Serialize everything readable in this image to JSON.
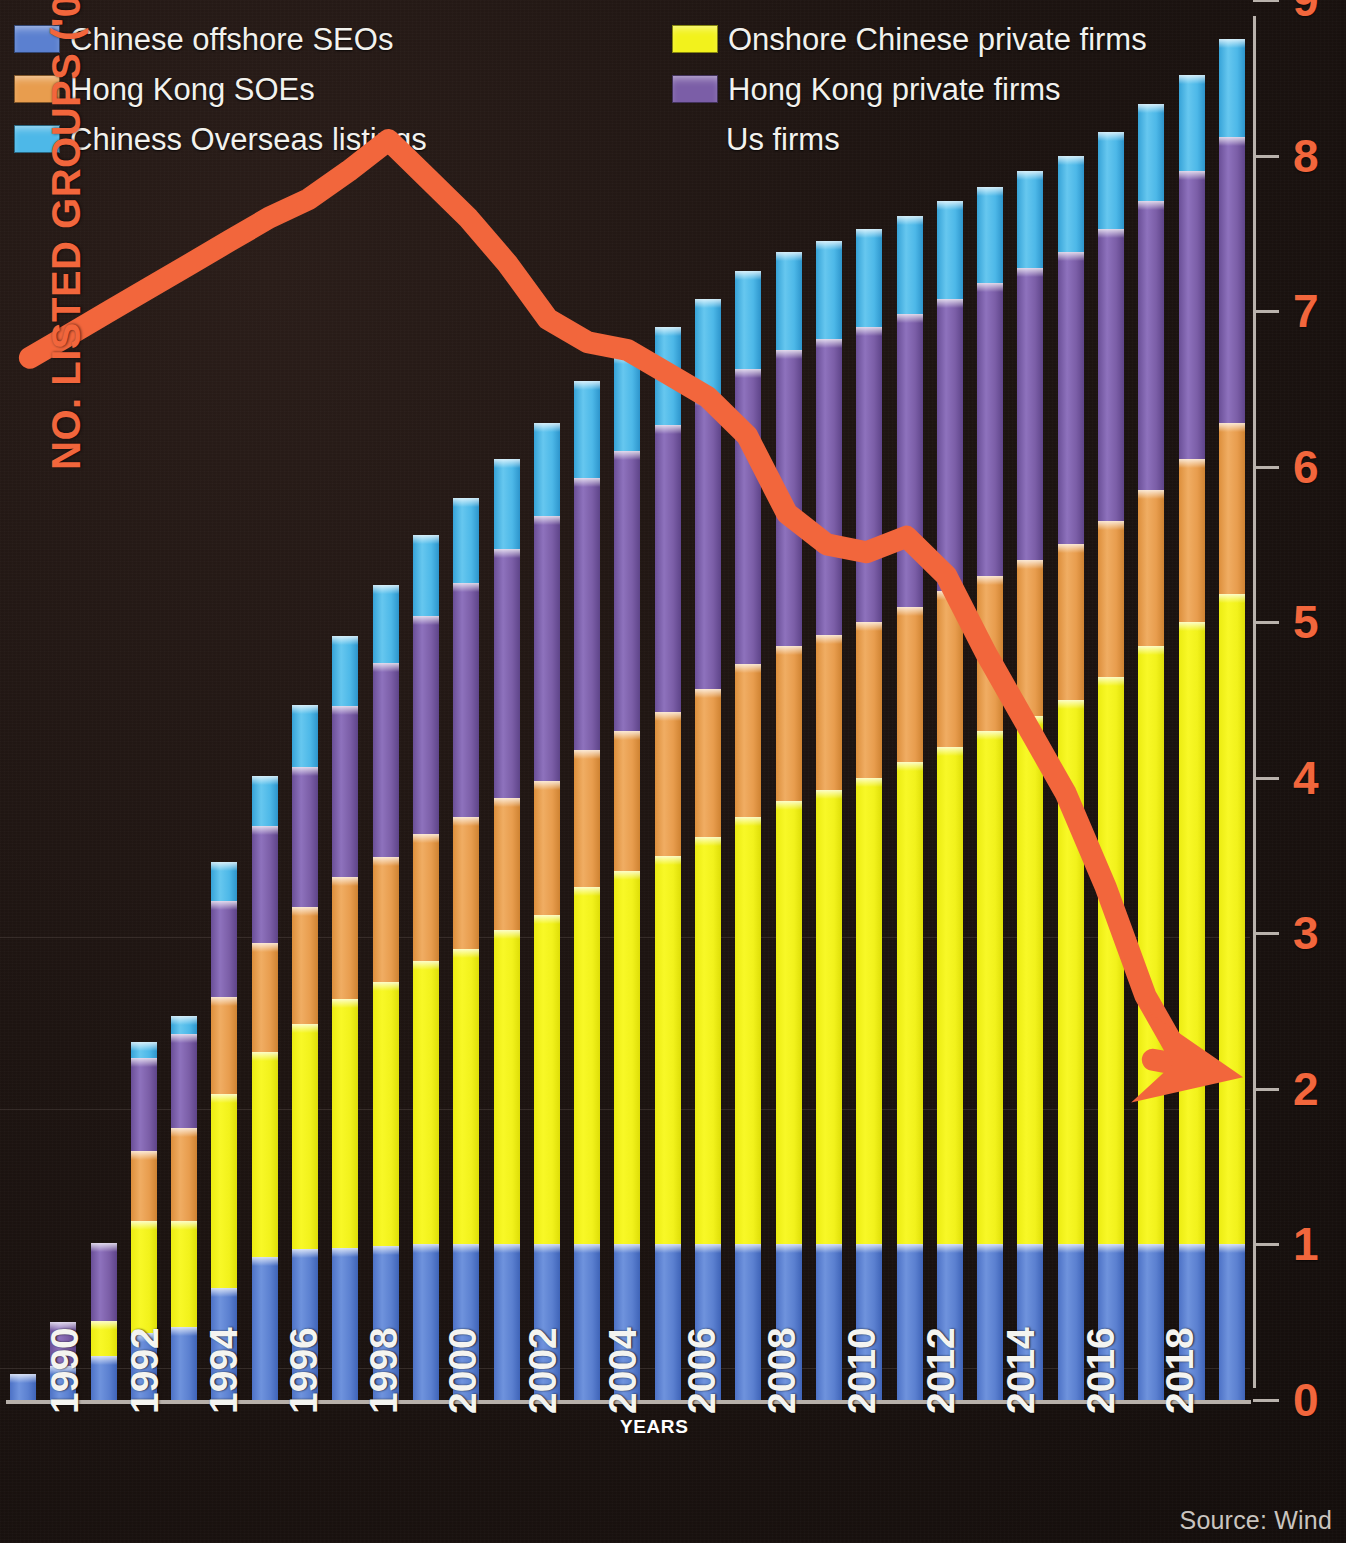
{
  "legend": {
    "items": [
      {
        "label": "Chinese offshore SEOs",
        "color": "#5b80d0",
        "icon": "legend-swatch",
        "col": "left"
      },
      {
        "label": "Hong Kong SOEs",
        "color": "#e89d4e",
        "icon": "legend-swatch",
        "col": "left"
      },
      {
        "label": "Chiness Overseas listings",
        "color": "#4db8e8",
        "icon": "legend-swatch",
        "col": "left"
      },
      {
        "label": "Onshore Chinese private firms",
        "color": "#f2f21c",
        "icon": "legend-swatch",
        "col": "right"
      },
      {
        "label": "Hong Kong private firms",
        "color": "#7b5ea7",
        "icon": "legend-swatch",
        "col": "right"
      },
      {
        "label": "Us firms",
        "color": "#f2663c",
        "icon": "arrow-marker",
        "col": "right"
      }
    ]
  },
  "axis": {
    "y_title": "NO. LISTED GROUPS ('000)",
    "y_ticks": [
      "0",
      "1",
      "2",
      "3",
      "4",
      "5",
      "6",
      "7",
      "8",
      "9"
    ],
    "y_min": 0,
    "y_max": 9,
    "x_title": "YEARS",
    "x_tick_labels": [
      "1990",
      "1992",
      "1994",
      "1996",
      "1998",
      "2000",
      "2002",
      "2004",
      "2006",
      "2008",
      "2010",
      "2012",
      "2014",
      "2016",
      "2018"
    ],
    "axis_color": "#f2663c"
  },
  "source": "Source: Wind",
  "chart_data": {
    "type": "bar",
    "title": "",
    "xlabel": "YEARS",
    "ylabel": "NO. LISTED GROUPS ('000)",
    "ylim": [
      0,
      9
    ],
    "grid": false,
    "legend_position": "top",
    "stacked": true,
    "categories": [
      "1990",
      "1991",
      "1992",
      "1993",
      "1994",
      "1995",
      "1996",
      "1997",
      "1998",
      "1999",
      "2000",
      "2001",
      "2002",
      "2003",
      "2004",
      "2005",
      "2006",
      "2007",
      "2008",
      "2009",
      "2010",
      "2011",
      "2012",
      "2013",
      "2014",
      "2015",
      "2016",
      "2017",
      "2018",
      "2019",
      "2020"
    ],
    "series": [
      {
        "name": "Chinese offshore SEOs",
        "color": "#5b80d0",
        "values": [
          0.17,
          0.22,
          0.28,
          0.43,
          0.47,
          0.72,
          0.92,
          0.97,
          0.98,
          0.99,
          1.0,
          1.0,
          1.0,
          1.0,
          1.0,
          1.0,
          1.0,
          1.0,
          1.0,
          1.0,
          1.0,
          1.0,
          1.0,
          1.0,
          1.0,
          1.0,
          1.0,
          1.0,
          1.0,
          1.0,
          1.0
        ]
      },
      {
        "name": "Onshore Chinese private firms",
        "color": "#f2f21c",
        "values": [
          0.0,
          0.0,
          0.23,
          0.72,
          0.68,
          1.25,
          1.32,
          1.45,
          1.6,
          1.7,
          1.82,
          1.9,
          2.02,
          2.12,
          2.3,
          2.4,
          2.5,
          2.62,
          2.75,
          2.85,
          2.92,
          3.0,
          3.1,
          3.2,
          3.3,
          3.4,
          3.5,
          3.65,
          3.85,
          4.0,
          4.18
        ]
      },
      {
        "name": "Hong Kong SOEs",
        "color": "#e89d4e",
        "values": [
          0.0,
          0.0,
          0.0,
          0.45,
          0.6,
          0.62,
          0.7,
          0.75,
          0.78,
          0.8,
          0.82,
          0.85,
          0.85,
          0.86,
          0.88,
          0.9,
          0.92,
          0.95,
          0.98,
          1.0,
          1.0,
          1.0,
          1.0,
          1.0,
          1.0,
          1.0,
          1.0,
          1.0,
          1.0,
          1.05,
          1.1
        ]
      },
      {
        "name": "Hong Kong private firms",
        "color": "#7b5ea7",
        "values": [
          0.0,
          0.28,
          0.5,
          0.6,
          0.6,
          0.62,
          0.75,
          0.9,
          1.1,
          1.25,
          1.4,
          1.5,
          1.6,
          1.7,
          1.75,
          1.8,
          1.85,
          1.88,
          1.9,
          1.9,
          1.9,
          1.9,
          1.88,
          1.88,
          1.88,
          1.88,
          1.88,
          1.88,
          1.86,
          1.85,
          1.84
        ]
      },
      {
        "name": "Chiness Overseas listings",
        "color": "#4db8e8",
        "values": [
          0.0,
          0.0,
          0.0,
          0.1,
          0.12,
          0.25,
          0.32,
          0.4,
          0.45,
          0.5,
          0.52,
          0.55,
          0.58,
          0.6,
          0.62,
          0.62,
          0.63,
          0.63,
          0.63,
          0.63,
          0.63,
          0.63,
          0.63,
          0.63,
          0.62,
          0.62,
          0.62,
          0.62,
          0.62,
          0.62,
          0.63
        ]
      }
    ],
    "overlay_line": {
      "name": "Us firms",
      "color": "#f2663c",
      "type": "line",
      "arrow_end": true,
      "values": [
        6.7,
        6.85,
        7.0,
        7.15,
        7.3,
        7.45,
        7.6,
        7.72,
        7.9,
        8.1,
        7.85,
        7.6,
        7.3,
        6.95,
        6.8,
        6.75,
        6.6,
        6.45,
        6.2,
        5.7,
        5.5,
        5.45,
        5.55,
        5.3,
        4.8,
        4.35,
        3.9,
        3.3,
        2.6,
        2.15,
        2.1
      ]
    }
  }
}
